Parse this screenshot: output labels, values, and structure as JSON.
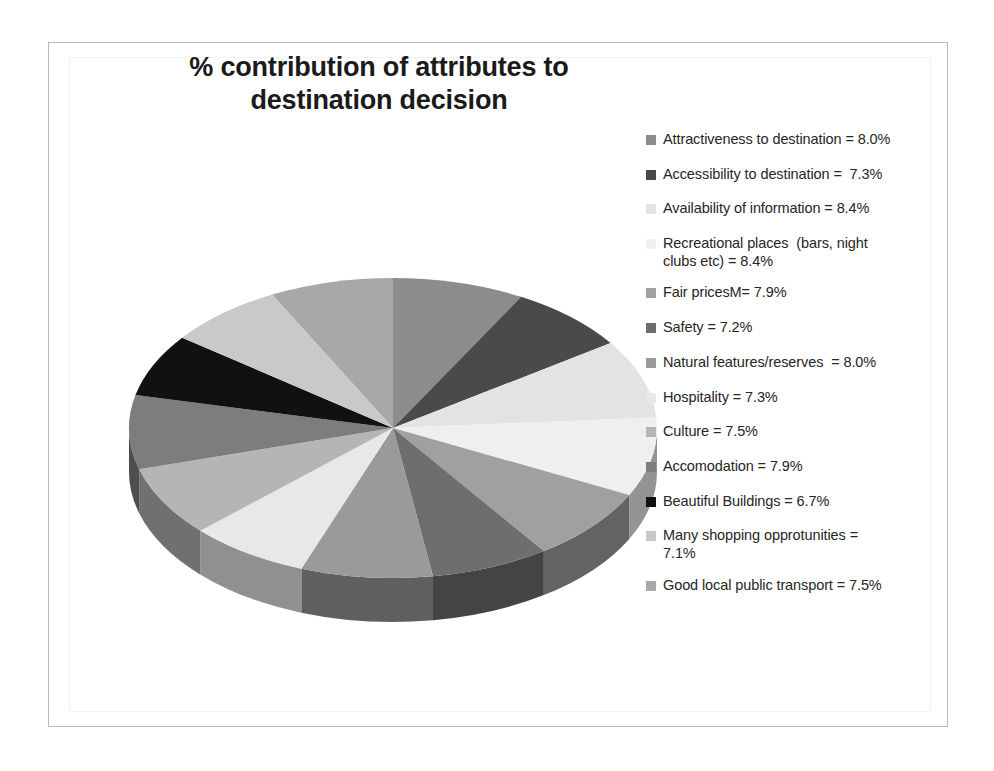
{
  "chart_title_lines": [
    "% contribution of attributes to",
    "destination decision"
  ],
  "chart_data": {
    "type": "pie",
    "title": "% contribution of attributes to destination decision",
    "subtitle": "",
    "xlabel": "",
    "ylabel": "",
    "legend_position": "right",
    "three_d": true,
    "units": "%",
    "categories": [
      "Attractiveness to destination",
      "Accessibility to destination",
      "Availability of information",
      "Recreational places  (bars, night clubs etc)",
      "Fair pricesM",
      "Safety",
      "Natural features/reserves",
      "Hospitality",
      "Culture",
      "Accomodation",
      "Beautiful Buildings",
      "Many shopping opprotunities",
      "Good local public transport"
    ],
    "values": [
      8.0,
      7.3,
      8.4,
      8.4,
      7.9,
      7.2,
      8.0,
      7.3,
      7.5,
      7.9,
      6.7,
      7.1,
      7.5
    ],
    "colors": [
      "#8c8c8c",
      "#4a4a4a",
      "#e3e3e3",
      "#efefef",
      "#a0a0a0",
      "#6e6e6e",
      "#9a9a9a",
      "#e8e8e8",
      "#b5b5b5",
      "#7d7d7d",
      "#111111",
      "#c9c9c9",
      "#a8a8a8"
    ]
  },
  "legend": {
    "items": [
      {
        "label": "Attractiveness to destination = 8.0%",
        "color": "#8c8c8c",
        "name": "attractiveness-to-destination"
      },
      {
        "label": "Accessibility to destination =  7.3%",
        "color": "#4a4a4a",
        "name": "accessibility-to-destination"
      },
      {
        "label": "Availability of information = 8.4%",
        "color": "#e3e3e3",
        "name": "availability-of-information"
      },
      {
        "label": "Recreational places  (bars, night\nclubs etc) = 8.4%",
        "color": "#efefef",
        "name": "recreational-places"
      },
      {
        "label": "Fair pricesM= 7.9%",
        "color": "#a0a0a0",
        "name": "fair-prices"
      },
      {
        "label": "Safety = 7.2%",
        "color": "#6e6e6e",
        "name": "safety"
      },
      {
        "label": "Natural features/reserves  = 8.0%",
        "color": "#9a9a9a",
        "name": "natural-features-reserves"
      },
      {
        "label": "Hospitality = 7.3%",
        "color": "#e8e8e8",
        "name": "hospitality"
      },
      {
        "label": "Culture = 7.5%",
        "color": "#b5b5b5",
        "name": "culture"
      },
      {
        "label": "Accomodation = 7.9%",
        "color": "#7d7d7d",
        "name": "accomodation"
      },
      {
        "label": "Beautiful Buildings = 6.7%",
        "color": "#111111",
        "name": "beautiful-buildings"
      },
      {
        "label": "Many shopping opprotunities =\n7.1%",
        "color": "#c9c9c9",
        "name": "many-shopping-opprotunities"
      },
      {
        "label": "Good local public transport = 7.5%",
        "color": "#a8a8a8",
        "name": "good-local-public-transport"
      }
    ]
  }
}
